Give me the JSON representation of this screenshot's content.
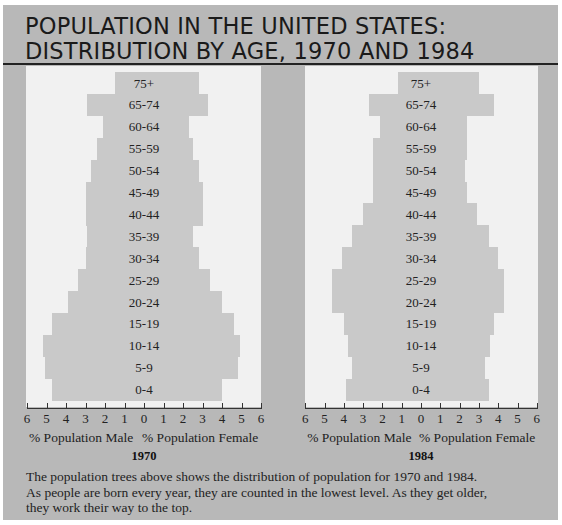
{
  "title": {
    "line1": "POPULATION IN THE UNITED STATES:",
    "line2": "DISTRIBUTION BY AGE, 1970 AND 1984"
  },
  "caption": {
    "line1": "The population trees above shows the distribution of population for 1970 and 1984.",
    "line2": "As people are born every year, they are counted in the lowest level. As they get older,",
    "line3": "they work their way to the top."
  },
  "colors": {
    "frame": "#b8b8b8",
    "panel": "#f1f1f1",
    "bar": "#c9c9c9",
    "text": "#222222"
  },
  "chart_data": [
    {
      "type": "bar",
      "subtype": "population-pyramid",
      "title": "1970",
      "xlabel_left": "% Population Male",
      "xlabel_right": "% Population Female",
      "xticks": [
        "6",
        "5",
        "4",
        "3",
        "2",
        "1",
        "0",
        "1",
        "2",
        "3",
        "4",
        "5",
        "6"
      ],
      "xlim": [
        -6,
        6
      ],
      "grid": false,
      "categories": [
        "75+",
        "65-74",
        "60-64",
        "55-59",
        "50-54",
        "45-49",
        "40-44",
        "35-39",
        "30-34",
        "25-29",
        "20-24",
        "15-19",
        "10-14",
        "5-9",
        "0-4"
      ],
      "series": [
        {
          "name": "Male",
          "values": [
            1.5,
            2.9,
            2.1,
            2.4,
            2.7,
            3.0,
            3.0,
            2.9,
            3.0,
            3.4,
            3.9,
            4.7,
            5.2,
            5.1,
            4.7
          ]
        },
        {
          "name": "Female",
          "values": [
            2.8,
            3.3,
            2.3,
            2.5,
            2.8,
            3.0,
            3.0,
            2.5,
            2.8,
            3.4,
            4.0,
            4.6,
            4.9,
            4.8,
            4.0
          ]
        }
      ]
    },
    {
      "type": "bar",
      "subtype": "population-pyramid",
      "title": "1984",
      "xlabel_left": "% Population Male",
      "xlabel_right": "% Population Female",
      "xticks": [
        "6",
        "5",
        "4",
        "3",
        "2",
        "1",
        "0",
        "1",
        "2",
        "3",
        "4",
        "5",
        "6"
      ],
      "xlim": [
        -6,
        6
      ],
      "grid": false,
      "categories": [
        "75+",
        "65-74",
        "60-64",
        "55-59",
        "50-54",
        "45-49",
        "40-44",
        "35-39",
        "30-34",
        "25-29",
        "20-24",
        "15-19",
        "10-14",
        "5-9",
        "0-4"
      ],
      "series": [
        {
          "name": "Male",
          "values": [
            1.2,
            2.7,
            2.1,
            2.5,
            2.5,
            2.5,
            3.0,
            3.6,
            4.1,
            4.6,
            4.6,
            4.0,
            3.8,
            3.6,
            3.9
          ]
        },
        {
          "name": "Female",
          "values": [
            3.0,
            3.8,
            2.4,
            2.4,
            2.3,
            2.4,
            2.9,
            3.5,
            4.0,
            4.3,
            4.3,
            3.8,
            3.6,
            3.3,
            3.5
          ]
        }
      ]
    }
  ]
}
